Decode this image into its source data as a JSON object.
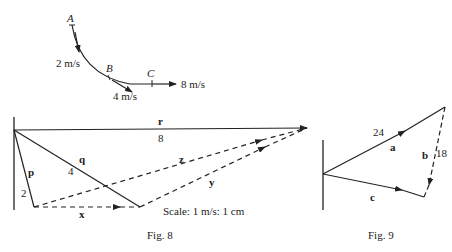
{
  "fig_path": {
    "points": {
      "A": "A",
      "B": "B",
      "C": "C"
    },
    "velocities": {
      "a": "2 m/s",
      "b": "4 m/s",
      "c": "8 m/s"
    }
  },
  "fig8": {
    "caption": "Fig. 8",
    "scale": "Scale: 1 m/s: 1 cm",
    "vectors": {
      "r": {
        "name": "r",
        "magnitude": "8"
      },
      "q": {
        "name": "q",
        "magnitude": "4"
      },
      "p": {
        "name": "p",
        "magnitude": "2"
      },
      "x": {
        "name": "x"
      },
      "y": {
        "name": "y"
      },
      "z": {
        "name": "z"
      }
    }
  },
  "fig9": {
    "caption": "Fig. 9",
    "vectors": {
      "a": {
        "name": "a",
        "magnitude": "24"
      },
      "b": {
        "name": "b",
        "magnitude": "18"
      },
      "c": {
        "name": "c"
      }
    }
  }
}
